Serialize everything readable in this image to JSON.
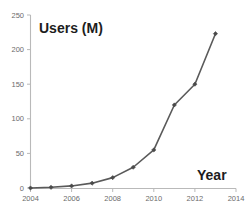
{
  "chart_data": {
    "type": "line",
    "title": "",
    "xlabel": "Year",
    "ylabel": "Users (M)",
    "x": [
      2004,
      2005,
      2006,
      2007,
      2008,
      2009,
      2010,
      2011,
      2012,
      2013
    ],
    "values": [
      0,
      1,
      3,
      7,
      15,
      30,
      55,
      120,
      150,
      223
    ],
    "series": [
      {
        "name": "Users (M)",
        "values": [
          0,
          1,
          3,
          7,
          15,
          30,
          55,
          120,
          150,
          223
        ]
      }
    ],
    "xlim": [
      2004,
      2014
    ],
    "ylim": [
      0,
      250
    ],
    "xticks": [
      2004,
      2006,
      2008,
      2010,
      2012,
      2014
    ],
    "xtick_labels": [
      "2004",
      "2006",
      "2008",
      "2010",
      "2012",
      "2014"
    ],
    "yticks": [
      0,
      50,
      100,
      150,
      200,
      250
    ],
    "ytick_labels": [
      "0",
      "50",
      "100",
      "150",
      "200",
      "250"
    ],
    "grid": false,
    "legend": false,
    "legend_position": "none",
    "marker": "diamond",
    "line_color": "#5a5a5a",
    "marker_color": "#4a4a4a",
    "axis_color": "#b9b9b9",
    "tick_label_color": "#6b6b6b",
    "axis_title_color": "#1d1d1d",
    "background_color": "#ffffff"
  },
  "labels": {
    "y_axis_title": "Users (M)",
    "x_axis_title": "Year"
  }
}
